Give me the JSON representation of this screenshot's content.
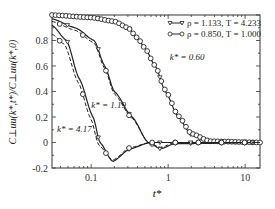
{
  "chart_data": {
    "type": "line",
    "title": "",
    "xlabel": "t*",
    "ylabel": "C⊥uu(k*,t*)/C⊥uu(k*,0)",
    "xscale": "log",
    "xlim": [
      0.031,
      15.6
    ],
    "ylim": [
      -0.2,
      1.0
    ],
    "x_ticks": [
      0.1,
      1,
      10
    ],
    "x_tick_labels": [
      "0.1",
      "1",
      "10"
    ],
    "y_ticks": [
      -0.2,
      0,
      0.2,
      0.4,
      0.6,
      0.8
    ],
    "y_tick_labels": [
      "-0.2",
      "0",
      "0.2",
      "0.4",
      "0.6",
      "0.8"
    ],
    "grid": false,
    "legend_position": "upper right",
    "legend": [
      {
        "marker": "triangle-down",
        "label": "ρ = 1.133, T = 4.233"
      },
      {
        "marker": "circle",
        "label": "ρ = 0.850, T = 1.000"
      }
    ],
    "annotations": [
      {
        "text": "k* = 0.60",
        "x": 1.05,
        "y": 0.65
      },
      {
        "text": "k* = 1.19",
        "x": 0.1,
        "y": 0.27
      },
      {
        "text": "k* = 4.17",
        "x": 0.036,
        "y": 0.08
      }
    ],
    "series": [
      {
        "name": "k* = 0.60, ρ = 1.133, T = 4.233",
        "style": "solid",
        "marker": "triangle-down",
        "x": [
          0.031,
          0.1,
          0.2,
          0.3,
          0.4,
          0.5,
          0.68,
          0.92,
          1.35,
          2.0,
          3.5,
          15.6
        ],
        "y": [
          1.0,
          0.98,
          0.95,
          0.9,
          0.82,
          0.74,
          0.6,
          0.4,
          0.2,
          0.06,
          0.0,
          0.0
        ]
      },
      {
        "name": "k* = 0.60, ρ = 0.850, T = 1.000",
        "style": "markers",
        "marker": "circle",
        "x": [
          0.031,
          0.1,
          0.2,
          0.3,
          0.4,
          0.5,
          0.68,
          0.92,
          1.35,
          2.0,
          3.5,
          15.6
        ],
        "y": [
          1.0,
          0.98,
          0.95,
          0.9,
          0.82,
          0.74,
          0.6,
          0.41,
          0.21,
          0.07,
          0.01,
          0.0
        ]
      },
      {
        "name": "k* = 1.19, ρ = 1.133, T = 4.233",
        "style": "solid",
        "marker": "triangle-down",
        "x": [
          0.031,
          0.062,
          0.11,
          0.15,
          0.2,
          0.34,
          0.55,
          0.8,
          1.2,
          15.6
        ],
        "y": [
          0.97,
          0.9,
          0.8,
          0.6,
          0.4,
          0.2,
          0.0,
          -0.05,
          -0.01,
          0.0
        ]
      },
      {
        "name": "k* = 1.19, ρ = 0.850, T = 1.000",
        "style": "dashed",
        "marker": "circle",
        "x": [
          0.031,
          0.062,
          0.11,
          0.15,
          0.2,
          0.34,
          0.55,
          0.8,
          1.2,
          15.6
        ],
        "y": [
          0.95,
          0.88,
          0.78,
          0.58,
          0.38,
          0.19,
          0.0,
          -0.04,
          0.0,
          0.0
        ]
      },
      {
        "name": "k* = 4.17, ρ = 1.133, T = 4.233",
        "style": "solid",
        "marker": "triangle-down",
        "x": [
          0.031,
          0.048,
          0.07,
          0.106,
          0.13,
          0.19,
          0.32,
          0.58,
          15.6
        ],
        "y": [
          0.92,
          0.8,
          0.5,
          0.2,
          0.0,
          -0.15,
          -0.05,
          0.0,
          0.0
        ]
      },
      {
        "name": "k* = 4.17, ρ = 0.850, T = 1.000",
        "style": "dashed",
        "marker": "circle",
        "x": [
          0.031,
          0.045,
          0.068,
          0.1,
          0.125,
          0.19,
          0.32,
          0.58,
          15.6
        ],
        "y": [
          0.85,
          0.77,
          0.47,
          0.18,
          -0.02,
          -0.14,
          -0.04,
          0.0,
          0.0
        ]
      }
    ]
  }
}
